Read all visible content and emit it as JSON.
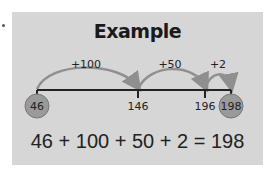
{
  "card": {
    "title": "Example",
    "background": "#d6d6d6",
    "arrow_color": "#8f8f8f",
    "circle_fill": "#9a9a9a",
    "number_line": {
      "points": [
        {
          "value": "46",
          "x": 37,
          "circled": true
        },
        {
          "value": "146",
          "x": 138,
          "circled": false
        },
        {
          "value": "196",
          "x": 205,
          "circled": false
        },
        {
          "value": "198",
          "x": 231,
          "circled": true
        }
      ],
      "jumps": [
        {
          "label": "+100",
          "from": 37,
          "to": 138
        },
        {
          "label": "+50",
          "from": 138,
          "to": 205
        },
        {
          "label": "+2",
          "from": 205,
          "to": 231
        }
      ]
    },
    "equation": "46 + 100 + 50 + 2 = 198"
  }
}
